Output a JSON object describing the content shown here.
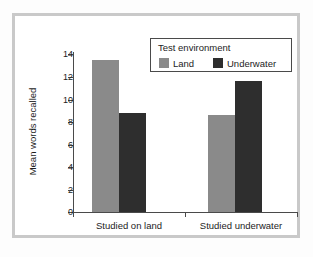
{
  "chart_data": {
    "type": "bar",
    "title": "",
    "xlabel": "",
    "ylabel": "Mean words recalled",
    "categories": [
      "Studied on land",
      "Studied underwater"
    ],
    "series": [
      {
        "name": "Land",
        "color": "#8a8a8a",
        "values": [
          13.5,
          8.6
        ]
      },
      {
        "name": "Underwater",
        "color": "#2e2e2e",
        "values": [
          8.8,
          11.6
        ]
      }
    ],
    "ylim": [
      0,
      14
    ],
    "ytick_labels": [
      "0",
      "2",
      "4",
      "6",
      "8",
      "10",
      "12",
      "14"
    ],
    "ytick_values": [
      0,
      2,
      4,
      6,
      8,
      10,
      12,
      14
    ],
    "grid": false,
    "legend": {
      "title": "Test environment",
      "position": "upper-right-inside",
      "entries": [
        {
          "label": "Land",
          "color": "#8a8a8a"
        },
        {
          "label": "Underwater",
          "color": "#2e2e2e"
        }
      ]
    }
  },
  "figure": {
    "frame_color": "#c9c9c9",
    "background": "#ffffff",
    "axis_color": "#4a4a4a",
    "text_color": "#1d1d1d"
  }
}
